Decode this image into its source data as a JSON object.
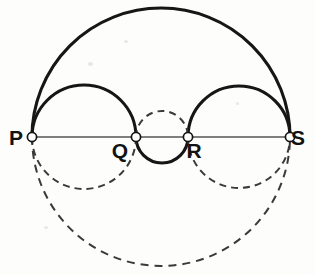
{
  "figure": {
    "background_color": "#fdfdfc",
    "width": 315,
    "height": 275
  },
  "baseline": {
    "name": "segment-PS",
    "y": 137,
    "x_start": 32,
    "x_end": 290,
    "color": "#555555",
    "stroke_width": 1.6
  },
  "points": [
    {
      "id": "P",
      "label": "P",
      "x": 32,
      "y": 137,
      "label_x": 16,
      "label_y": 145,
      "marker_radius": 4.6
    },
    {
      "id": "Q",
      "label": "Q",
      "x": 136,
      "y": 137,
      "label_x": 120,
      "label_y": 158,
      "marker_radius": 4.6
    },
    {
      "id": "R",
      "label": "R",
      "x": 188,
      "y": 137,
      "label_x": 194,
      "label_y": 158,
      "marker_radius": 4.6
    },
    {
      "id": "S",
      "label": "S",
      "x": 290,
      "y": 137,
      "label_x": 298,
      "label_y": 145,
      "marker_radius": 4.6
    }
  ],
  "arcs": [
    {
      "id": "arc-PS-upper",
      "name": "large-semicircle-PS-upper",
      "from": "P",
      "to": "S",
      "center_x": 161,
      "radius": 129,
      "side": "upper",
      "style": "solid",
      "stroke_width": 3.1,
      "color": "#161616",
      "dash": "none"
    },
    {
      "id": "arc-PQ-upper",
      "name": "semicircle-PQ-upper",
      "from": "P",
      "to": "Q",
      "center_x": 84,
      "radius": 52,
      "side": "upper",
      "style": "solid",
      "stroke_width": 3.1,
      "color": "#161616",
      "dash": "none"
    },
    {
      "id": "arc-RS-upper",
      "name": "semicircle-RS-upper",
      "from": "R",
      "to": "S",
      "center_x": 239,
      "radius": 51,
      "side": "upper",
      "style": "solid",
      "stroke_width": 3.1,
      "color": "#161616",
      "dash": "none"
    },
    {
      "id": "arc-QR-lower",
      "name": "semicircle-QR-lower",
      "from": "Q",
      "to": "R",
      "center_x": 162,
      "radius": 26,
      "side": "lower",
      "style": "solid",
      "stroke_width": 3.1,
      "color": "#161616",
      "dash": "none"
    },
    {
      "id": "arc-QR-upper",
      "name": "semicircle-QR-upper-dashed",
      "from": "Q",
      "to": "R",
      "center_x": 162,
      "radius": 26,
      "side": "upper",
      "style": "dashed",
      "stroke_width": 2.0,
      "color": "#3a3a3a",
      "dash": "7 5"
    },
    {
      "id": "arc-PQ-lower",
      "name": "semicircle-PQ-lower-dashed",
      "from": "P",
      "to": "Q",
      "center_x": 84,
      "radius": 52,
      "side": "lower",
      "style": "dashed",
      "stroke_width": 2.0,
      "color": "#3a3a3a",
      "dash": "7 5"
    },
    {
      "id": "arc-RS-lower",
      "name": "semicircle-RS-lower-dashed",
      "from": "R",
      "to": "S",
      "center_x": 239,
      "radius": 51,
      "side": "lower",
      "style": "dashed",
      "stroke_width": 2.0,
      "color": "#3a3a3a",
      "dash": "7 5"
    },
    {
      "id": "arc-PS-lower",
      "name": "large-semicircle-PS-lower-dashed",
      "from": "P",
      "to": "S",
      "center_x": 161,
      "radius": 129,
      "side": "lower",
      "style": "dashed",
      "stroke_width": 2.0,
      "color": "#3a3a3a",
      "dash": "8 6"
    }
  ]
}
